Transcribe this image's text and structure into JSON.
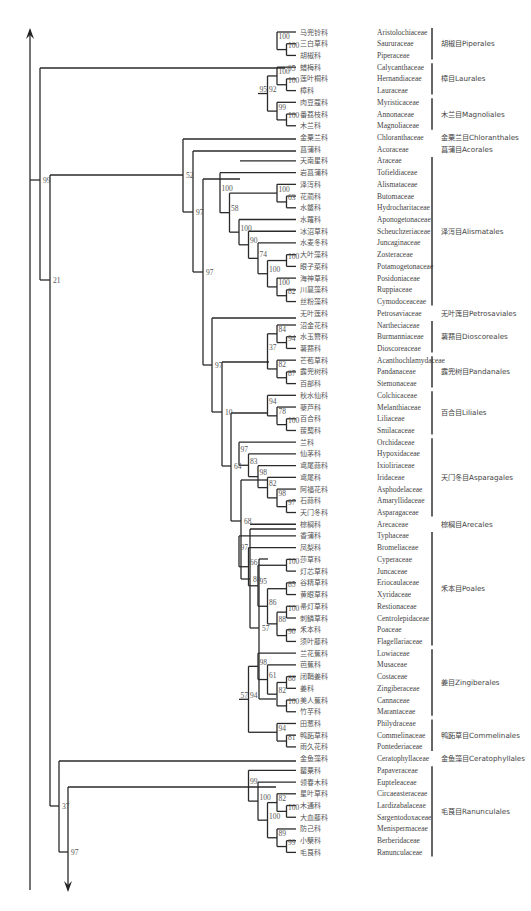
{
  "diagram": {
    "type": "phylogenetic-tree",
    "row_start_y": 32,
    "row_step": 11.72,
    "tip_x": 296,
    "cn_x": 300,
    "latin_x": 377,
    "bar_x": 432,
    "order_x": 441,
    "axis": {
      "x": 30,
      "top_y": 30,
      "bottom_y": 282,
      "arrow": "up"
    },
    "bottom_axis": {
      "x": 68,
      "top_y": 860,
      "bottom_y": 890,
      "arrow": "down"
    }
  },
  "taxa": [
    {
      "cn": "马兜铃科",
      "latin": "Aristolochiaceae"
    },
    {
      "cn": "三白草科",
      "latin": "Saururaceae"
    },
    {
      "cn": "胡椒科",
      "latin": "Piperaceae"
    },
    {
      "cn": "蜡梅科",
      "latin": "Calycanthaceae"
    },
    {
      "cn": "莲叶桐科",
      "latin": "Hernandiaceae"
    },
    {
      "cn": "樟科",
      "latin": "Lauraceae"
    },
    {
      "cn": "肉豆蔻科",
      "latin": "Myristicaceae"
    },
    {
      "cn": "番荔枝科",
      "latin": "Annonaceae"
    },
    {
      "cn": "木兰科",
      "latin": "Magnoliaceae"
    },
    {
      "cn": "金粟兰科",
      "latin": "Chloranthaceae"
    },
    {
      "cn": "菖蒲科",
      "latin": "Acoraceae"
    },
    {
      "cn": "天南星科",
      "latin": "Araceae"
    },
    {
      "cn": "岩菖蒲科",
      "latin": "Tofieldiaceae"
    },
    {
      "cn": "泽泻科",
      "latin": "Alismataceae"
    },
    {
      "cn": "花蔺科",
      "latin": "Butomaceae"
    },
    {
      "cn": "水鳖科",
      "latin": "Hydrocharitaceae"
    },
    {
      "cn": "水蕹科",
      "latin": "Aponogetonaceae"
    },
    {
      "cn": "冰沼草科",
      "latin": "Scheuchzeriaceae"
    },
    {
      "cn": "水麦冬科",
      "latin": "Juncaginaceae"
    },
    {
      "cn": "大叶藻科",
      "latin": "Zosteraceae"
    },
    {
      "cn": "眼子菜科",
      "latin": "Potamogetonaceae"
    },
    {
      "cn": "海神草科",
      "latin": "Posidoniaceae"
    },
    {
      "cn": "川蔓藻科",
      "latin": "Ruppiaceae"
    },
    {
      "cn": "丝粉藻科",
      "latin": "Cymodoceaceae"
    },
    {
      "cn": "无叶莲科",
      "latin": "Petrosaviaceae"
    },
    {
      "cn": "沼金花科",
      "latin": "Nartheciaceae"
    },
    {
      "cn": "水玉簪科",
      "latin": "Burmanniaceae"
    },
    {
      "cn": "薯蓣科",
      "latin": "Dioscoreaceae"
    },
    {
      "cn": "芒苞草科",
      "latin": "Acanthochlamydaceae"
    },
    {
      "cn": "露兜树科",
      "latin": "Pandanaceae"
    },
    {
      "cn": "百部科",
      "latin": "Stemonaceae"
    },
    {
      "cn": "秋水仙科",
      "latin": "Colchicaceae"
    },
    {
      "cn": "藜芦科",
      "latin": "Melanthiaceae"
    },
    {
      "cn": "百合科",
      "latin": "Liliaceae"
    },
    {
      "cn": "菝葜科",
      "latin": "Smilacaceae"
    },
    {
      "cn": "兰科",
      "latin": "Orchidaceae"
    },
    {
      "cn": "仙茅科",
      "latin": "Hypoxidaceae"
    },
    {
      "cn": "鸢尾蒜科",
      "latin": "Ixioliriaceae"
    },
    {
      "cn": "鸢尾科",
      "latin": "Iridaceae"
    },
    {
      "cn": "阿福花科",
      "latin": "Asphodelaceae"
    },
    {
      "cn": "石蒜科",
      "latin": "Amaryllidaceae"
    },
    {
      "cn": "天门冬科",
      "latin": "Asparagaceae"
    },
    {
      "cn": "棕榈科",
      "latin": "Arecaceae"
    },
    {
      "cn": "香蒲科",
      "latin": "Typhaceae"
    },
    {
      "cn": "凤梨科",
      "latin": "Bromeliaceae"
    },
    {
      "cn": "莎草科",
      "latin": "Cyperaceae"
    },
    {
      "cn": "灯芯草科",
      "latin": "Juncaceae"
    },
    {
      "cn": "谷精草科",
      "latin": "Eriocaulaceae"
    },
    {
      "cn": "黄眼草科",
      "latin": "Xyridaceae"
    },
    {
      "cn": "帚灯草科",
      "latin": "Restionaceae"
    },
    {
      "cn": "刺鳞草科",
      "latin": "Centrolepidaceae"
    },
    {
      "cn": "禾本科",
      "latin": "Poaceae"
    },
    {
      "cn": "须叶藤科",
      "latin": "Flagellariaceae"
    },
    {
      "cn": "兰花蕉科",
      "latin": "Lowiaceae"
    },
    {
      "cn": "芭蕉科",
      "latin": "Musaceae"
    },
    {
      "cn": "闭鞘姜科",
      "latin": "Costaceae"
    },
    {
      "cn": "姜科",
      "latin": "Zingiberaceae"
    },
    {
      "cn": "美人蕉科",
      "latin": "Cannaceae"
    },
    {
      "cn": "竹芋科",
      "latin": "Marantaceae"
    },
    {
      "cn": "田葱科",
      "latin": "Philydraceae"
    },
    {
      "cn": "鸭跖草科",
      "latin": "Commelinaceae"
    },
    {
      "cn": "雨久花科",
      "latin": "Pontederiaceae"
    },
    {
      "cn": "金鱼藻科",
      "latin": "Ceratophyllaceae"
    },
    {
      "cn": "罂粟科",
      "latin": "Papaveraceae"
    },
    {
      "cn": "领春木科",
      "latin": "Eupteleaceae"
    },
    {
      "cn": "星叶草科",
      "latin": "Circaeasteraceae"
    },
    {
      "cn": "木通科",
      "latin": "Lardizabalaceae"
    },
    {
      "cn": "大血藤科",
      "latin": "Sargentodoxaceae"
    },
    {
      "cn": "防己科",
      "latin": "Menispermaceae"
    },
    {
      "cn": "小檗科",
      "latin": "Berberidaceae"
    },
    {
      "cn": "毛茛科",
      "latin": "Ranunculaceae"
    }
  ],
  "orders": [
    {
      "label": "胡椒目Piperales",
      "from": 0,
      "to": 2
    },
    {
      "label": "樟目Laurales",
      "from": 3,
      "to": 5
    },
    {
      "label": "木兰目Magnoliales",
      "from": 6,
      "to": 8
    },
    {
      "label": "金粟兰目Chloranthales",
      "from": 9,
      "to": 9,
      "nobar": true
    },
    {
      "label": "菖蒲目Acorales",
      "from": 10,
      "to": 10,
      "nobar": true
    },
    {
      "label": "泽泻目Alismatales",
      "from": 11,
      "to": 23
    },
    {
      "label": "无叶莲目Petrosaviales",
      "from": 24,
      "to": 24,
      "nobar": true
    },
    {
      "label": "薯蓣目Dioscoreales",
      "from": 25,
      "to": 27
    },
    {
      "label": "露兜树目Pandanales",
      "from": 28,
      "to": 30
    },
    {
      "label": "百合目Liliales",
      "from": 31,
      "to": 34
    },
    {
      "label": "天门冬目Asparagales",
      "from": 35,
      "to": 41
    },
    {
      "label": "棕榈目Arecales",
      "from": 42,
      "to": 42,
      "nobar": true
    },
    {
      "label": "禾本目Poales",
      "from": 43,
      "to": 52
    },
    {
      "label": "姜目Zingiberales",
      "from": 53,
      "to": 58
    },
    {
      "label": "鸭跖草目Commelinales",
      "from": 59,
      "to": 61
    },
    {
      "label": "金鱼藻目Ceratophyllales",
      "from": 62,
      "to": 62,
      "nobar": true
    },
    {
      "label": "毛茛目Ranunculales",
      "from": 63,
      "to": 70
    }
  ],
  "tree_newick": "((((Aristolochiaceae,(Saururaceae,Piperaceae)100)100,(((Calycanthaceae,(Hernandiaceae,Lauraceae)100)100,(Myristicaceae,(Annonaceae,Magnoliaceae)100)99)92)95,(Chloranthaceae,(Acoraceae,((Araceae,(Tofieldiaceae,((Alismataceae,(Butomaceae,Hydrocharitaceae)63)100,(Aponogetonaceae,(Scheuchzeriaceae,(Juncaginaceae,((Zosteraceae,Potamogetonaceae)100,(Posidoniaceae,(Ruppiaceae,Cymodoceaceae)82)100)100)74)90)100)58)100)97,(Petrosaviaceae,(((Nartheciaceae,(Burmanniaceae,Dioscoreaceae)94)84,(Acanthochlamydaceae,(Pandanaceae,Stemonaceae)87)82)37,((Colchicaceae,(Melanthiaceae,(Liliaceae,Smilacaceae)100)78)94,((Orchidaceae,(Hypoxidaceae,(Ixioliriaceae,(Iridaceae,(Asphodelaceae,(Amaryllidaceae,Asparagaceae)97)98)82)98)83)97,(Arecaceae,((Typhaceae,(Bromeliaceae,((Cyperaceae,Juncaceae)100,((Eriocaulaceae,Xyridaceae)85,((Restionaceae,Centrolepidaceae)100,(Poaceae,Flagellariaceae)90)88)86)95)66)97,(((Lowiaceae,(Musaceae,((Costaceae,Zingiberaceae)88,(Cannaceae,Marantaceae)100)82)61)98,(Philydraceae,(Commelinaceae,Pontederiaceae)81)94)94)57)80)68)64)10)97)97)97)52)99,(Ceratophyllaceae,(Papaveraceae,(Eupteleaceae,((Circaeasteraceae,(Lardizabalaceae,Sargentodoxaceae)100)82,(Menispermaceae,(Berberidaceae,Ranunculaceae)99)89)100)100)99)97)37)21",
  "branches": [
    {
      "x1": 30,
      "y1": 282,
      "x2": 30,
      "y2": 890
    },
    {
      "x1": 30,
      "y1": 180,
      "x2": 40,
      "y2": 180
    },
    {
      "x1": 40,
      "y1": 68,
      "x2": 40,
      "y2": 280
    },
    {
      "x1": 40,
      "y1": 68,
      "x2": 285,
      "y2": 68
    },
    {
      "x1": 40,
      "y1": 280,
      "x2": 50,
      "y2": 280
    },
    {
      "x1": 50,
      "y1": 175,
      "x2": 50,
      "y2": 806
    },
    {
      "x1": 50,
      "y1": 175,
      "x2": 183,
      "y2": 175
    },
    {
      "x1": 183,
      "y1": 139,
      "x2": 183,
      "y2": 212
    },
    {
      "x1": 183,
      "y1": 139,
      "x2": 296,
      "y2": 139
    },
    {
      "x1": 183,
      "y1": 212,
      "x2": 193,
      "y2": 212
    },
    {
      "x1": 193,
      "y1": 151,
      "x2": 193,
      "y2": 272
    },
    {
      "x1": 193,
      "y1": 151,
      "x2": 296,
      "y2": 151
    },
    {
      "x1": 193,
      "y1": 272,
      "x2": 203,
      "y2": 272
    },
    {
      "x1": 203,
      "y1": 179,
      "x2": 203,
      "y2": 365
    },
    {
      "x1": 203,
      "y1": 179,
      "x2": 240,
      "y2": 179
    },
    {
      "x1": 203,
      "y1": 365,
      "x2": 212,
      "y2": 365
    },
    {
      "x1": 212,
      "y1": 318,
      "x2": 212,
      "y2": 412
    },
    {
      "x1": 212,
      "y1": 318,
      "x2": 296,
      "y2": 318
    },
    {
      "x1": 212,
      "y1": 412,
      "x2": 222,
      "y2": 412
    },
    {
      "x1": 222,
      "y1": 362,
      "x2": 222,
      "y2": 466
    },
    {
      "x1": 222,
      "y1": 362,
      "x2": 269,
      "y2": 362
    },
    {
      "x1": 222,
      "y1": 466,
      "x2": 231,
      "y2": 466
    },
    {
      "x1": 231,
      "y1": 413,
      "x2": 231,
      "y2": 521
    },
    {
      "x1": 231,
      "y1": 413,
      "x2": 268,
      "y2": 413
    },
    {
      "x1": 231,
      "y1": 521,
      "x2": 241,
      "y2": 521
    },
    {
      "x1": 241,
      "y1": 480,
      "x2": 241,
      "y2": 579
    },
    {
      "x1": 241,
      "y1": 480,
      "x2": 268,
      "y2": 480
    },
    {
      "x1": 241,
      "y1": 579,
      "x2": 250,
      "y2": 579
    },
    {
      "x1": 250,
      "y1": 529,
      "x2": 250,
      "y2": 628
    },
    {
      "x1": 250,
      "y1": 529,
      "x2": 296,
      "y2": 529
    },
    {
      "x1": 250,
      "y1": 628,
      "x2": 259,
      "y2": 628
    },
    {
      "x1": 259,
      "y1": 559,
      "x2": 259,
      "y2": 699
    },
    {
      "x1": 259,
      "y1": 559,
      "x2": 268,
      "y2": 559
    },
    {
      "x1": 259,
      "y1": 699,
      "x2": 276,
      "y2": 699
    },
    {
      "x1": 50,
      "y1": 806,
      "x2": 59,
      "y2": 806
    },
    {
      "x1": 59,
      "y1": 761,
      "x2": 59,
      "y2": 852
    },
    {
      "x1": 59,
      "y1": 761,
      "x2": 296,
      "y2": 761
    },
    {
      "x1": 59,
      "y1": 852,
      "x2": 68,
      "y2": 852
    },
    {
      "x1": 68,
      "y1": 787,
      "x2": 68,
      "y2": 890
    },
    {
      "x1": 68,
      "y1": 787,
      "x2": 276,
      "y2": 787
    }
  ],
  "deep_labels": [
    {
      "x": 43,
      "y": 183,
      "v": "99"
    },
    {
      "x": 53,
      "y": 283,
      "v": "21"
    },
    {
      "x": 186,
      "y": 178,
      "v": "52"
    },
    {
      "x": 196,
      "y": 215,
      "v": "97"
    },
    {
      "x": 206,
      "y": 275,
      "v": "97"
    },
    {
      "x": 215,
      "y": 368,
      "v": "97"
    },
    {
      "x": 225,
      "y": 415,
      "v": "10"
    },
    {
      "x": 234,
      "y": 469,
      "v": "64"
    },
    {
      "x": 244,
      "y": 524,
      "v": "68"
    },
    {
      "x": 253,
      "y": 582,
      "v": "80"
    },
    {
      "x": 262,
      "y": 631,
      "v": "57"
    },
    {
      "x": 62,
      "y": 809,
      "v": "37"
    },
    {
      "x": 71,
      "y": 855,
      "v": "97"
    },
    {
      "x": 288,
      "y": 71,
      "v": "95"
    }
  ]
}
